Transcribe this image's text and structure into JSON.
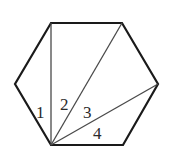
{
  "diagram": {
    "shape": "regular hexagon",
    "stroke_color": "#1a1a1a",
    "inner_line_color": "#4a4a4a",
    "vertices": [
      [
        51,
        23
      ],
      [
        122,
        23
      ],
      [
        158,
        84
      ],
      [
        123,
        145
      ],
      [
        51,
        145
      ],
      [
        15,
        84
      ]
    ],
    "apex": [
      51,
      145
    ],
    "diagonals": [
      {
        "to": [
          51,
          23
        ]
      },
      {
        "to": [
          122,
          23
        ]
      },
      {
        "to": [
          158,
          84
        ]
      }
    ],
    "labels": [
      {
        "text": "1",
        "x": 36,
        "y": 118
      },
      {
        "text": "2",
        "x": 60,
        "y": 110
      },
      {
        "text": "3",
        "x": 83,
        "y": 118
      },
      {
        "text": "4",
        "x": 93,
        "y": 139
      }
    ]
  }
}
